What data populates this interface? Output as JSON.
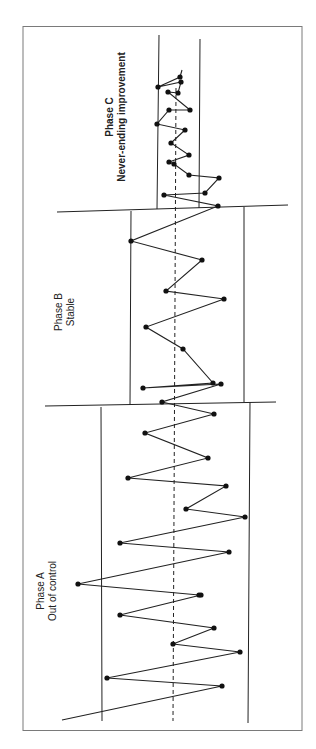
{
  "chart_data": {
    "type": "line",
    "orientation": "rotated-90-ccw (time runs bottom to top, value runs left to right)",
    "title": "",
    "xlabel": "",
    "ylabel": "",
    "grid": false,
    "phases": [
      {
        "name": "Phase A",
        "subtitle": "Out of control",
        "bold": false
      },
      {
        "name": "Phase B",
        "subtitle": "Stable",
        "bold": false
      },
      {
        "name": "Phase C",
        "subtitle": "Never-ending improvement",
        "bold": true
      }
    ],
    "center_line": "dashed",
    "control_limits": {
      "phase_a": {
        "lower_x": 102,
        "upper_x": 248
      },
      "phase_b": {
        "lower_x": 130,
        "upper_x": 244
      },
      "phase_c": {
        "lower_x": 158,
        "upper_x": 199
      }
    },
    "center_x": 174,
    "series": [
      {
        "name": "process",
        "points_screen": [
          [
            62,
            720
          ],
          [
            222,
            686
          ],
          [
            107,
            678
          ],
          [
            240,
            652
          ],
          [
            173,
            644
          ],
          [
            214,
            628
          ],
          [
            120,
            615
          ],
          [
            201,
            595
          ],
          [
            199,
            595
          ],
          [
            78,
            584
          ],
          [
            229,
            552
          ],
          [
            120,
            543
          ],
          [
            245,
            517
          ],
          [
            186,
            509
          ],
          [
            226,
            486
          ],
          [
            128,
            478
          ],
          [
            208,
            458
          ],
          [
            145,
            433
          ],
          [
            214,
            414
          ],
          [
            162,
            402
          ],
          [
            221,
            384
          ],
          [
            143,
            388
          ],
          [
            213,
            383
          ],
          [
            183,
            349
          ],
          [
            146,
            327
          ],
          [
            224,
            299
          ],
          [
            166,
            291
          ],
          [
            202,
            260
          ],
          [
            131,
            241
          ],
          [
            218,
            206
          ],
          [
            164,
            195
          ],
          [
            205,
            193
          ],
          [
            219,
            178
          ],
          [
            189,
            175
          ],
          [
            174,
            164
          ],
          [
            169,
            162
          ],
          [
            189,
            155
          ],
          [
            171,
            143
          ],
          [
            185,
            130
          ],
          [
            157,
            124
          ],
          [
            169,
            110
          ],
          [
            190,
            110
          ],
          [
            168,
            92
          ],
          [
            178,
            93
          ],
          [
            181,
            82
          ],
          [
            158,
            87
          ],
          [
            180,
            77
          ],
          [
            182,
            70
          ]
        ]
      }
    ]
  },
  "labels": {
    "phase_a_title": "Phase A",
    "phase_a_sub": "Out of control",
    "phase_b_title": "Phase B",
    "phase_b_sub": "Stable",
    "phase_c_title": "Phase C",
    "phase_c_sub": "Never-ending improvement"
  },
  "colors": {
    "line": "#222222",
    "frame": "#7a7a7a",
    "background": "#ffffff"
  }
}
